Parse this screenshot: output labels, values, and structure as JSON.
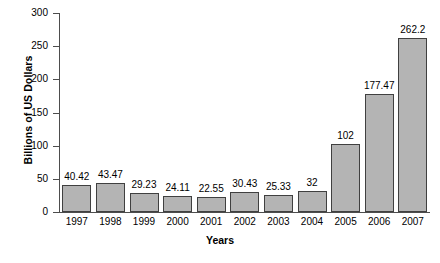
{
  "chart_data": {
    "type": "bar",
    "title": "",
    "xlabel": "Years",
    "ylabel": "Billions of US Dollars",
    "categories": [
      "1997",
      "1998",
      "1999",
      "2000",
      "2001",
      "2002",
      "2003",
      "2004",
      "2005",
      "2006",
      "2007"
    ],
    "values": [
      40.42,
      43.47,
      29.23,
      24.11,
      22.55,
      30.43,
      25.33,
      32,
      102,
      177.47,
      262.2
    ],
    "value_labels": [
      "40.42",
      "43.47",
      "29.23",
      "24.11",
      "22.55",
      "30.43",
      "25.33",
      "32",
      "102",
      "177.47",
      "262.2"
    ],
    "ylim": [
      0,
      300
    ],
    "yticks": [
      0,
      50,
      100,
      150,
      200,
      250,
      300
    ],
    "ytick_labels": [
      "0",
      "50",
      "100",
      "150",
      "200",
      "250",
      "300"
    ],
    "grid": false,
    "legend": false,
    "legend_position": "none",
    "bar_fill_color": "#b4b4b4",
    "bar_border_color": "#404040",
    "axis_color": "#4d4d4d",
    "background_color": "#ffffff"
  }
}
